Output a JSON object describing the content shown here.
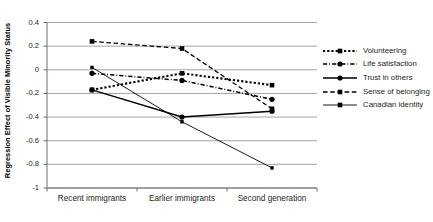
{
  "chart_data": {
    "type": "line",
    "title": "",
    "xlabel": "",
    "ylabel": "Regression Effect of Visible Minority Status",
    "categories": [
      "Recent immigrants",
      "Earlier immigrants",
      "Second generation"
    ],
    "ylim": [
      -1,
      0.4
    ],
    "ytick_labels": [
      "0.4",
      "0.2",
      "0",
      "-0.2",
      "-0.4",
      "-0.6",
      "-0.8",
      "-1"
    ],
    "ytick_values": [
      0.4,
      0.2,
      0,
      -0.2,
      -0.4,
      -0.6,
      -0.8,
      -1
    ],
    "grid": true,
    "legend_position": "right",
    "series": [
      {
        "name": "Volunteering",
        "values": [
          -0.17,
          -0.03,
          -0.13
        ],
        "style": "dotted",
        "marker": "square"
      },
      {
        "name": "Life satisfaction",
        "values": [
          -0.03,
          -0.09,
          -0.25
        ],
        "style": "dashdot",
        "marker": "circle"
      },
      {
        "name": "Trust in others",
        "values": [
          -0.17,
          -0.4,
          -0.35
        ],
        "style": "solid",
        "marker": "circle"
      },
      {
        "name": "Sense of belonging",
        "values": [
          0.24,
          0.18,
          -0.33
        ],
        "style": "dashed",
        "marker": "square"
      },
      {
        "name": "Canadian identity",
        "values": [
          0.02,
          -0.44,
          -0.83
        ],
        "style": "thin",
        "marker": "square"
      }
    ]
  },
  "colors": {
    "series": "#000000",
    "grid": "#9a9a9a",
    "axis": "#6f6f6f",
    "text": "#231f20"
  }
}
